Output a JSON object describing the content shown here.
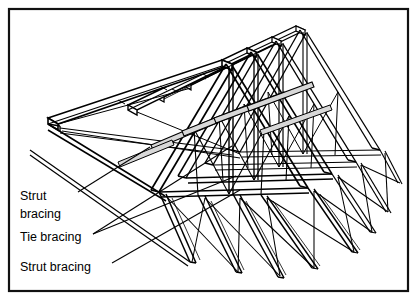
{
  "figure": {
    "width": 417,
    "height": 307,
    "background_color": "#ffffff",
    "line_color": "#000000",
    "border": {
      "name": "figure-border",
      "x": 9,
      "y": 9,
      "width": 399,
      "height": 282,
      "stroke_width": 2.2,
      "color": "#111111"
    }
  },
  "labels": [
    {
      "id": "strut-bracing-upper",
      "lines": [
        "Strut",
        "bracing"
      ],
      "x": 20,
      "y": 200,
      "line_height": 18,
      "leader": {
        "from_x": 78,
        "from_y": 192,
        "to_x": 150,
        "to_y": 147
      }
    },
    {
      "id": "tie-bracing",
      "lines": [
        "Tie bracing"
      ],
      "x": 20,
      "y": 241,
      "line_height": 18,
      "leader": {
        "from_x": 93,
        "from_y": 234,
        "to_x": 232,
        "to_y": 146
      }
    },
    {
      "id": "strut-bracing-lower",
      "lines": [
        "Strut bracing"
      ],
      "x": 20,
      "y": 271,
      "line_height": 18,
      "leader": {
        "from_x": 112,
        "from_y": 263,
        "to_x": 240,
        "to_y": 190
      }
    }
  ],
  "structure": {
    "description": "Four nested roof trusses drawn in isometric projection with ridge purlins, sloping rafters, vertical and diagonal web members, longitudinal tie bracing and diagonal strut bracing.",
    "truss_count": 4,
    "members": [
      "ridge-purlin",
      "rafter",
      "web-diagonal",
      "web-vertical",
      "tie-bracing-diagonal",
      "strut-bracing-diagonal",
      "eaves-tie"
    ]
  }
}
